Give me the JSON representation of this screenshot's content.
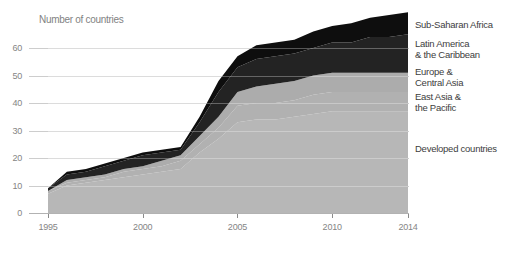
{
  "chart_data": {
    "type": "area",
    "stacked": true,
    "title": "Number of countries",
    "x": [
      1995,
      1996,
      1997,
      1998,
      1999,
      2000,
      2001,
      2002,
      2003,
      2004,
      2005,
      2006,
      2007,
      2008,
      2009,
      2010,
      2011,
      2012,
      2013,
      2014
    ],
    "x_tick_labels": [
      "1995",
      "2000",
      "2005",
      "2010",
      "2014"
    ],
    "x_tick_indexes": [
      0,
      5,
      10,
      15,
      19
    ],
    "y_ticks": [
      0,
      10,
      20,
      30,
      40,
      50,
      60
    ],
    "ylim": [
      0,
      76
    ],
    "xlabel": "",
    "ylabel": "",
    "grid": true,
    "legend_position": "right",
    "series": [
      {
        "name": "Developed countries",
        "color": "#b7b7b7",
        "values": [
          7,
          10,
          11,
          12,
          13,
          14,
          15,
          16,
          22,
          27,
          33,
          34,
          34,
          35,
          36,
          37,
          37,
          37,
          37,
          37
        ]
      },
      {
        "name": "East Asia & the Pacific",
        "color": "#b1b1b1",
        "values": [
          1,
          1,
          1,
          1,
          2,
          2,
          2,
          3,
          3,
          4,
          6,
          6,
          6,
          6,
          7,
          7,
          7,
          7,
          7,
          7
        ]
      },
      {
        "name": "Europe & Central Asia",
        "color": "#acacac",
        "values": [
          0,
          1,
          1,
          1,
          1,
          1,
          2,
          2,
          3,
          4,
          5,
          6,
          7,
          7,
          7,
          7,
          7,
          7,
          7,
          7
        ]
      },
      {
        "name": "Latin America & the Caribbean",
        "color": "#232323",
        "values": [
          1,
          2,
          2,
          3,
          3,
          4,
          3,
          2,
          5,
          9,
          9,
          10,
          10,
          10,
          10,
          11,
          11,
          13,
          13,
          14
        ]
      },
      {
        "name": "Sub-Saharan Africa",
        "color": "#0e0e0e",
        "values": [
          0,
          1,
          1,
          1,
          1,
          1,
          1,
          1,
          2,
          4,
          4,
          5,
          5,
          5,
          6,
          6,
          7,
          7,
          8,
          8
        ]
      }
    ],
    "colors": {
      "grid": "#cdcdcd",
      "baseline": "#b2b2b2",
      "tick": "#8a8a8a",
      "axis_text": "#858585",
      "legend_text": "#3d3d3d",
      "background": "#ffffff"
    }
  },
  "legend": {
    "items": [
      {
        "name": "sub-saharan-africa",
        "lines": [
          "Sub-Saharan Africa"
        ]
      },
      {
        "name": "latin-america-caribbean",
        "lines": [
          "Latin America",
          "& the Caribbean"
        ]
      },
      {
        "name": "europe-central-asia",
        "lines": [
          "Europe &",
          "Central Asia"
        ]
      },
      {
        "name": "east-asia-pacific",
        "lines": [
          "East Asia &",
          "the Pacific"
        ]
      },
      {
        "name": "developed-countries",
        "lines": [
          "Developed countries"
        ]
      }
    ]
  }
}
